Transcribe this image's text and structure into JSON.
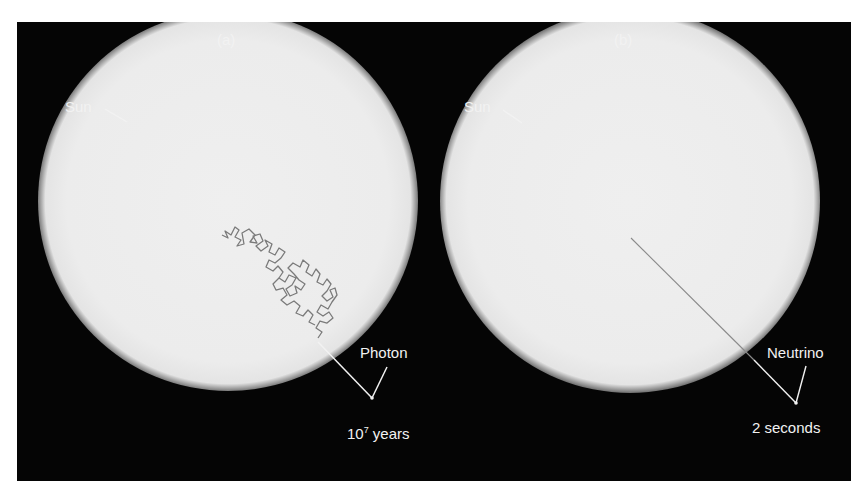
{
  "panels": [
    {
      "id": "a",
      "label": "(a)",
      "sun_label": "Sun",
      "particle_label": "Photon",
      "time_base": "10",
      "time_exp": "7",
      "time_unit": " years",
      "path_type": "random-walk"
    },
    {
      "id": "b",
      "label": "(b)",
      "sun_label": "Sun",
      "particle_label": "Neutrino",
      "time_text": "2 seconds",
      "path_type": "straight-line"
    }
  ],
  "colors": {
    "background": "#050505",
    "sun": "#ececec",
    "label": "#f2f2f2",
    "path": "#777777"
  }
}
